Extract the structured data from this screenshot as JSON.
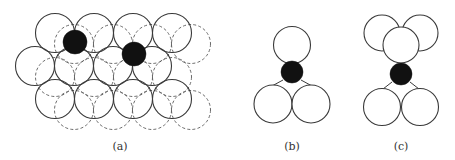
{
  "panels": [
    {
      "id": "a",
      "label": "(a)",
      "label_pos": [
        120,
        140
      ]
    },
    {
      "id": "b",
      "label": "(b)",
      "label_pos": [
        292,
        140
      ]
    },
    {
      "id": "c",
      "label": "(c)",
      "label_pos": [
        401,
        140
      ]
    }
  ],
  "colors": {
    "stroke": "#3a3a3a",
    "dashed": "#5a5a5a",
    "atom": "#111111"
  },
  "panel_a": {
    "radius": 19.5,
    "solid_layer": [
      [
        55,
        33
      ],
      [
        94,
        33
      ],
      [
        133,
        33
      ],
      [
        172,
        33
      ],
      [
        35,
        66
      ],
      [
        74,
        66
      ],
      [
        113,
        66
      ],
      [
        152,
        66
      ],
      [
        55,
        99
      ],
      [
        94,
        99
      ],
      [
        133,
        99
      ],
      [
        172,
        99
      ]
    ],
    "dashed_layer": [
      [
        74,
        44
      ],
      [
        113,
        44
      ],
      [
        152,
        44
      ],
      [
        191,
        44
      ],
      [
        55,
        77
      ],
      [
        94,
        77
      ],
      [
        133,
        77
      ],
      [
        172,
        77
      ],
      [
        74,
        110
      ],
      [
        113,
        110
      ],
      [
        152,
        110
      ],
      [
        191,
        110
      ]
    ],
    "atoms": [
      [
        75,
        42,
        12
      ],
      [
        134,
        54,
        12
      ]
    ]
  },
  "panel_b": {
    "white": [
      [
        292,
        45,
        18.5
      ],
      [
        273,
        104,
        19
      ],
      [
        311,
        104,
        19
      ]
    ],
    "atoms": [
      [
        292,
        72,
        11
      ]
    ],
    "bonds": [
      [
        283,
        80,
        272,
        86
      ],
      [
        301,
        80,
        312,
        86
      ]
    ]
  },
  "panel_c": {
    "white": [
      [
        382,
        33,
        18
      ],
      [
        420,
        33,
        18
      ],
      [
        401,
        45,
        18
      ],
      [
        382,
        107,
        18.5
      ],
      [
        420,
        107,
        18.5
      ]
    ],
    "atoms": [
      [
        401,
        74,
        11
      ]
    ],
    "bonds": [
      [
        392,
        82,
        383,
        89
      ],
      [
        410,
        82,
        419,
        89
      ]
    ]
  }
}
